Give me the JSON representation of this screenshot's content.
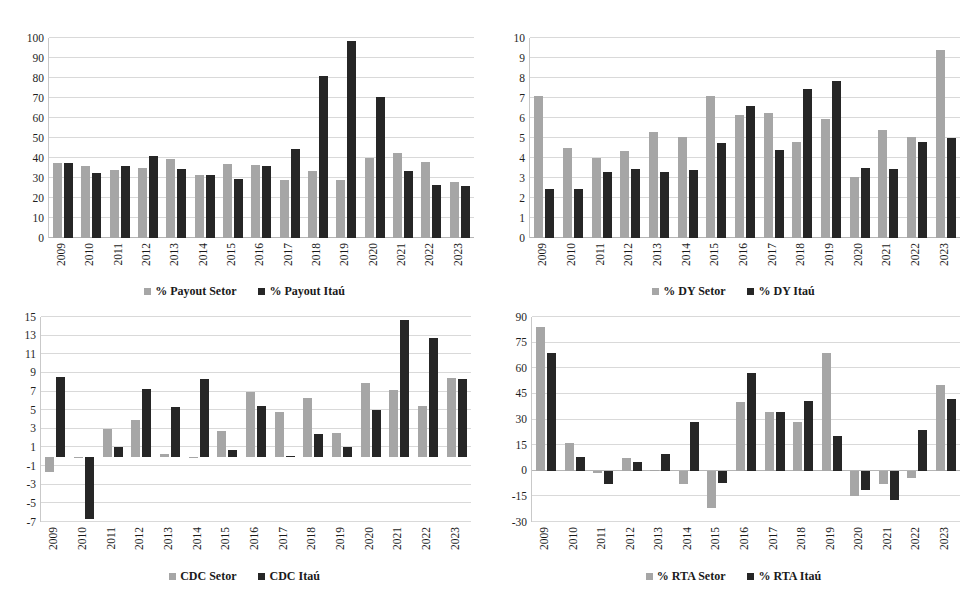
{
  "colors": {
    "setor": "#a6a6a6",
    "itau": "#262626",
    "gridline": "#d9d9d9",
    "background": "#ffffff"
  },
  "years": [
    "2009",
    "2010",
    "2011",
    "2012",
    "2013",
    "2014",
    "2015",
    "2016",
    "2017",
    "2018",
    "2019",
    "2020",
    "2021",
    "2022",
    "2023"
  ],
  "charts": [
    {
      "id": "payout",
      "chart_data": {
        "type": "bar",
        "title": "",
        "xlabel": "",
        "ylabel": "",
        "ylim": [
          0,
          100
        ],
        "yticks": [
          0,
          10,
          20,
          30,
          40,
          50,
          60,
          70,
          80,
          90,
          100
        ],
        "ytick_labels": [
          "0",
          "10",
          "20",
          "30",
          "40",
          "50",
          "60",
          "70",
          "80",
          "90",
          "100"
        ],
        "grid": true,
        "legend_position": "bottom",
        "categories": [
          "2009",
          "2010",
          "2011",
          "2012",
          "2013",
          "2014",
          "2015",
          "2016",
          "2017",
          "2018",
          "2019",
          "2020",
          "2021",
          "2022",
          "2023"
        ],
        "series": [
          {
            "name": "% Payout Setor",
            "color": "#a6a6a6",
            "values": [
              37.7,
              36.0,
              34.2,
              34.8,
              39.3,
              31.5,
              37.0,
              36.7,
              29.0,
              33.4,
              29.0,
              40.2,
              42.3,
              37.8,
              28.2
            ]
          },
          {
            "name": "% Payout Itaú",
            "color": "#262626",
            "values": [
              37.7,
              32.3,
              36.0,
              41.2,
              34.4,
              31.7,
              29.7,
              35.9,
              44.7,
              80.8,
              98.5,
              70.5,
              33.7,
              26.3,
              26.1
            ]
          }
        ]
      },
      "legend": [
        {
          "label": "% Payout Setor",
          "series": "setor"
        },
        {
          "label": "% Payout Itaú",
          "series": "itau"
        }
      ]
    },
    {
      "id": "dy",
      "chart_data": {
        "type": "bar",
        "title": "",
        "xlabel": "",
        "ylabel": "",
        "ylim": [
          0,
          10
        ],
        "yticks": [
          0,
          1,
          2,
          3,
          4,
          5,
          6,
          7,
          8,
          9,
          10
        ],
        "ytick_labels": [
          "0",
          "1",
          "2",
          "3",
          "4",
          "5",
          "6",
          "7",
          "8",
          "9",
          "10"
        ],
        "grid": true,
        "legend_position": "bottom",
        "categories": [
          "2009",
          "2010",
          "2011",
          "2012",
          "2013",
          "2014",
          "2015",
          "2016",
          "2017",
          "2018",
          "2019",
          "2020",
          "2021",
          "2022",
          "2023"
        ],
        "series": [
          {
            "name": "% DY Setor",
            "color": "#a6a6a6",
            "values": [
              7.1,
              4.5,
              4.0,
              4.35,
              5.3,
              5.05,
              7.1,
              6.15,
              6.25,
              4.8,
              5.95,
              3.05,
              5.4,
              5.05,
              9.4
            ]
          },
          {
            "name": "% DY Itaú",
            "color": "#262626",
            "values": [
              2.45,
              2.45,
              3.3,
              3.45,
              3.3,
              3.4,
              4.75,
              6.6,
              4.4,
              7.45,
              7.85,
              3.5,
              3.45,
              4.8,
              5.0
            ]
          }
        ]
      },
      "legend": [
        {
          "label": "% DY Setor",
          "series": "setor"
        },
        {
          "label": "% DY Itaú",
          "series": "itau"
        }
      ]
    },
    {
      "id": "cdc",
      "chart_data": {
        "type": "bar",
        "title": "",
        "xlabel": "",
        "ylabel": "",
        "ylim": [
          -7,
          15
        ],
        "yticks": [
          -7,
          -5,
          -3,
          -1,
          1,
          3,
          5,
          7,
          9,
          11,
          13,
          15
        ],
        "ytick_labels": [
          "-7",
          "-5",
          "-3",
          "-1",
          "1",
          "3",
          "5",
          "7",
          "9",
          "11",
          "13",
          "15"
        ],
        "grid": true,
        "legend_position": "bottom",
        "categories": [
          "2009",
          "2010",
          "2011",
          "2012",
          "2013",
          "2014",
          "2015",
          "2016",
          "2017",
          "2018",
          "2019",
          "2020",
          "2021",
          "2022",
          "2023"
        ],
        "series": [
          {
            "name": "CDC Setor",
            "color": "#a6a6a6",
            "values": [
              -1.6,
              -0.1,
              3.0,
              4.0,
              0.3,
              -0.15,
              2.8,
              7.0,
              4.85,
              6.3,
              2.6,
              7.9,
              7.2,
              5.4,
              8.5
            ]
          },
          {
            "name": "CDC Itaú",
            "color": "#262626",
            "values": [
              8.6,
              -6.7,
              1.0,
              7.3,
              5.3,
              8.3,
              0.7,
              5.4,
              0.0,
              2.4,
              1.0,
              5.0,
              14.7,
              12.8,
              8.4
            ]
          }
        ]
      },
      "legend": [
        {
          "label": "CDC Setor",
          "series": "setor"
        },
        {
          "label": "CDC Itaú",
          "series": "itau"
        }
      ]
    },
    {
      "id": "rta",
      "chart_data": {
        "type": "bar",
        "title": "",
        "xlabel": "",
        "ylabel": "",
        "ylim": [
          -30,
          90
        ],
        "yticks": [
          -30,
          -15,
          0,
          15,
          30,
          45,
          60,
          75,
          90
        ],
        "ytick_labels": [
          "-30",
          "-15",
          "0",
          "15",
          "30",
          "45",
          "60",
          "75",
          "90"
        ],
        "grid": true,
        "legend_position": "bottom",
        "categories": [
          "2009",
          "2010",
          "2011",
          "2012",
          "2013",
          "2014",
          "2015",
          "2016",
          "2017",
          "2018",
          "2019",
          "2020",
          "2021",
          "2022",
          "2023"
        ],
        "series": [
          {
            "name": "% RTA Setor",
            "color": "#a6a6a6",
            "values": [
              84.0,
              16.5,
              -1.5,
              7.5,
              0.0,
              -7.5,
              -22.0,
              40.0,
              34.5,
              28.5,
              69.0,
              -15.0,
              -8.0,
              -4.0,
              50.0
            ]
          },
          {
            "name": "% RTA Itaú",
            "color": "#262626",
            "values": [
              69.0,
              8.0,
              -8.0,
              5.0,
              10.0,
              28.5,
              -7.0,
              57.0,
              34.5,
              41.0,
              20.5,
              -11.0,
              -17.0,
              24.0,
              42.0
            ]
          }
        ]
      },
      "legend": [
        {
          "label": "% RTA Setor",
          "series": "setor"
        },
        {
          "label": "% RTA Itaú",
          "series": "itau"
        }
      ]
    }
  ]
}
